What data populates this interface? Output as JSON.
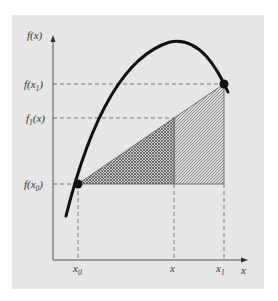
{
  "diagram": {
    "colors": {
      "panel_background": "#e6e6e6",
      "curve": "#111111",
      "axes": "#555555",
      "dashed_guides": "#666666",
      "hatch": "#555555"
    },
    "y_axis": {
      "label": "f(x)",
      "ticks": [
        {
          "label": "f(x",
          "sub": "1",
          "close": ")",
          "id": "f-x1"
        },
        {
          "label": "f",
          "sub": "1",
          "close": "(x)",
          "id": "f1-x"
        },
        {
          "label": "f(x",
          "sub": "0",
          "close": ")",
          "id": "f-x0"
        }
      ]
    },
    "x_axis": {
      "label": "x",
      "ticks": [
        {
          "label": "x",
          "sub": "0",
          "id": "x0"
        },
        {
          "label": "x",
          "sub": "",
          "id": "x"
        },
        {
          "label": "x",
          "sub": "1",
          "id": "x1"
        }
      ]
    },
    "points": [
      {
        "id": "p0",
        "name": "(x0, f(x0))"
      },
      {
        "id": "p1",
        "name": "(x1, f(x1))"
      }
    ],
    "regions": [
      {
        "id": "small-triangle",
        "fill": "crosshatch"
      },
      {
        "id": "large-triangle-rest",
        "fill": "diagonal-hatch"
      }
    ]
  }
}
